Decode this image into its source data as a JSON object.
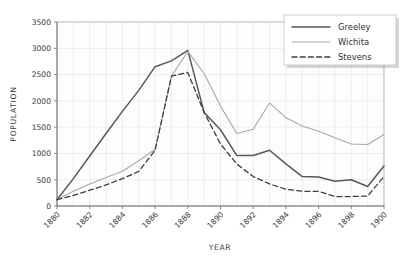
{
  "chart_data": {
    "type": "line",
    "title": "",
    "xlabel": "YEAR",
    "ylabel": "POPULATION",
    "xlim": [
      1880,
      1900
    ],
    "ylim": [
      0,
      3500
    ],
    "grid": true,
    "legend_position": "top-right",
    "x": [
      1880,
      1881,
      1882,
      1883,
      1884,
      1885,
      1886,
      1887,
      1888,
      1889,
      1890,
      1891,
      1892,
      1893,
      1894,
      1895,
      1896,
      1897,
      1898,
      1899,
      1900
    ],
    "xtick_labels": [
      "1880",
      "1882",
      "1884",
      "1886",
      "1888",
      "1890",
      "1892",
      "1894",
      "1896",
      "1898",
      "1900"
    ],
    "xtick_values": [
      1880,
      1882,
      1884,
      1886,
      1888,
      1890,
      1892,
      1894,
      1896,
      1898,
      1900
    ],
    "ytick_labels": [
      "0",
      "500",
      "1000",
      "1500",
      "2000",
      "2500",
      "3000",
      "3500"
    ],
    "ytick_values": [
      0,
      500,
      1000,
      1500,
      2000,
      2500,
      3000,
      3500
    ],
    "series": [
      {
        "name": "Greeley",
        "style": "solid",
        "color": "#58585c",
        "width": 1.5,
        "values": [
          120,
          520,
          950,
          1380,
          1800,
          2200,
          2650,
          2760,
          2960,
          1780,
          1450,
          960,
          960,
          1060,
          800,
          560,
          550,
          470,
          500,
          370,
          760
        ]
      },
      {
        "name": "Wichita",
        "style": "solid",
        "color": "#a8a8ad",
        "width": 1.1,
        "values": [
          120,
          280,
          420,
          540,
          660,
          860,
          1080,
          2470,
          2940,
          2520,
          1900,
          1380,
          1460,
          1960,
          1680,
          1520,
          1420,
          1300,
          1180,
          1170,
          1360
        ]
      },
      {
        "name": "Stevens",
        "style": "dashed",
        "color": "#3c3c40",
        "width": 1.3,
        "values": [
          120,
          200,
          300,
          400,
          520,
          660,
          1060,
          2470,
          2540,
          1780,
          1180,
          800,
          560,
          420,
          320,
          280,
          280,
          180,
          180,
          190,
          560
        ]
      }
    ]
  }
}
